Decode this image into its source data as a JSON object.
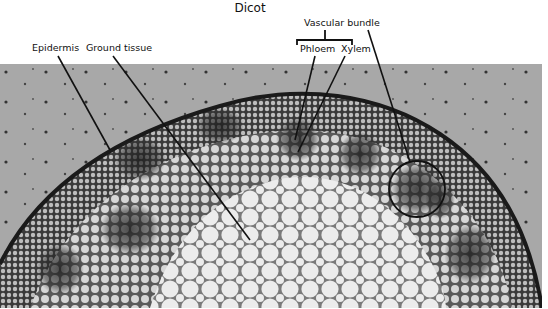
{
  "figure": {
    "title": "Dicot",
    "image_description": "Light micrograph of a dicot stem cross-section",
    "labels": {
      "epidermis": "Epidermis",
      "ground_tissue": "Ground tissue",
      "vascular_bundle": "Vascular bundle",
      "phloem": "Phloem",
      "xylem": "Xylem"
    },
    "colors": {
      "background": "#ffffff",
      "slide_background": "#a9a9a9",
      "label_line": "#111111",
      "tissue_dark": "#2a2a2a",
      "tissue_light": "#e8e8e8"
    }
  }
}
